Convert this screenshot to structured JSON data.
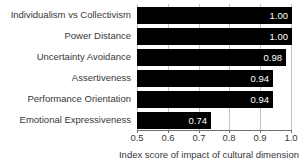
{
  "chart_data": {
    "type": "bar",
    "orientation": "horizontal",
    "title": "",
    "categories": [
      "Individualism vs Collectivism",
      "Power Distance",
      "Uncertainty Avoidance",
      "Assertiveness",
      "Performance Orientation",
      "Emotional Expressiveness"
    ],
    "values": [
      1.0,
      1.0,
      0.98,
      0.94,
      0.94,
      0.74
    ],
    "value_labels": [
      "1.00",
      "1.00",
      "0.98",
      "0.94",
      "0.94",
      "0.74"
    ],
    "xlabel": "Index score of impact of cultural dimension",
    "ylabel": "",
    "xlim": [
      0.5,
      1.0
    ],
    "xticks": [
      0.5,
      0.6,
      0.7,
      0.8,
      0.9,
      1.0
    ],
    "xtick_labels": [
      "0.5",
      "0.6",
      "0.7",
      "0.8",
      "0.9",
      "1.0"
    ],
    "grid": "vertical-gridlines-on",
    "legend": "none",
    "colors": {
      "bar": "#000000",
      "value_label": "#ffffff",
      "text": "#383838",
      "gridline": "#c4c4c4",
      "axis_line": "#707070",
      "background": "#ffffff"
    }
  }
}
